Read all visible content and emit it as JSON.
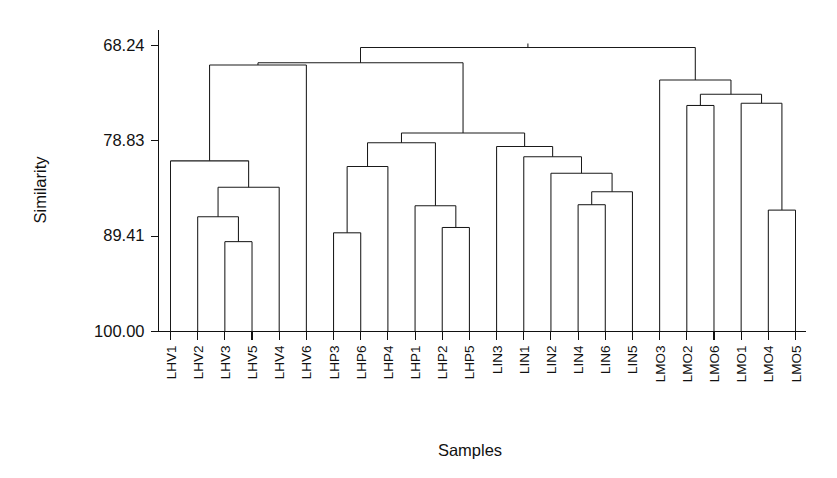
{
  "chart_data": {
    "type": "dendrogram",
    "title": "",
    "xlabel": "Samples",
    "ylabel": "Similarity",
    "grid": false,
    "legend": null,
    "axis_inverted": true,
    "ylim": [
      68.24,
      100.0
    ],
    "ytick_labels": [
      "68.24",
      "78.83",
      "89.41",
      "100.00"
    ],
    "ytick_values": [
      68.24,
      78.83,
      89.41,
      100.0
    ],
    "leaf_labels": [
      "LHV1",
      "LHV2",
      "LHV3",
      "LHV5",
      "LHV4",
      "LHV6",
      "LHP3",
      "LHP6",
      "LHP4",
      "LHP1",
      "LHP2",
      "LHP5",
      "LIN3",
      "LIN1",
      "LIN2",
      "LIN4",
      "LIN6",
      "LIN5",
      "LMO3",
      "LMO2",
      "LMO6",
      "LMO1",
      "LMO4",
      "LMO5"
    ],
    "n_leaves": 24,
    "groups": [
      {
        "name": "LHV",
        "members": [
          "LHV1",
          "LHV2",
          "LHV3",
          "LHV5",
          "LHV4",
          "LHV6"
        ]
      },
      {
        "name": "LHP",
        "members": [
          "LHP3",
          "LHP6",
          "LHP4",
          "LHP1",
          "LHP2",
          "LHP5"
        ]
      },
      {
        "name": "LIN",
        "members": [
          "LIN3",
          "LIN1",
          "LIN2",
          "LIN4",
          "LIN6",
          "LIN5"
        ]
      },
      {
        "name": "LMO",
        "members": [
          "LMO3",
          "LMO2",
          "LMO6",
          "LMO1",
          "LMO4",
          "LMO5"
        ]
      }
    ],
    "merges": [
      {
        "id": "m1",
        "left": "LHV3",
        "right": "LHV5",
        "similarity": 90.02
      },
      {
        "id": "m2",
        "left": "LHV2",
        "right": "m1",
        "similarity": 87.25
      },
      {
        "id": "m3",
        "left": "m2",
        "right": "LHV4",
        "similarity": 83.99
      },
      {
        "id": "m4",
        "left": "LHV1",
        "right": "m3",
        "similarity": 81.05
      },
      {
        "id": "m5",
        "left": "m4",
        "right": "LHV6",
        "similarity": 70.41
      },
      {
        "id": "m6",
        "left": "LHP3",
        "right": "LHP6",
        "similarity": 89.04
      },
      {
        "id": "m7",
        "left": "m6",
        "right": "LHP4",
        "similarity": 81.67
      },
      {
        "id": "m8",
        "left": "LHP2",
        "right": "LHP5",
        "similarity": 88.45
      },
      {
        "id": "m9",
        "left": "LHP1",
        "right": "m8",
        "similarity": 86.04
      },
      {
        "id": "m10",
        "left": "m7",
        "right": "m9",
        "similarity": 79.04
      },
      {
        "id": "m11",
        "left": "LIN4",
        "right": "LIN6",
        "similarity": 85.92
      },
      {
        "id": "m12",
        "left": "m11",
        "right": "LIN5",
        "similarity": 84.47
      },
      {
        "id": "m13",
        "left": "LIN2",
        "right": "m12",
        "similarity": 82.42
      },
      {
        "id": "m14",
        "left": "LIN1",
        "right": "m13",
        "similarity": 80.6
      },
      {
        "id": "m15",
        "left": "LIN3",
        "right": "m14",
        "similarity": 79.46
      },
      {
        "id": "m16",
        "left": "m10",
        "right": "m15",
        "similarity": 77.95
      },
      {
        "id": "m17",
        "left": "m5",
        "right": "m16",
        "similarity": 70.16
      },
      {
        "id": "m18",
        "left": "LMO4",
        "right": "LMO5",
        "similarity": 86.52
      },
      {
        "id": "m19",
        "left": "LMO1",
        "right": "m18",
        "similarity": 74.66
      },
      {
        "id": "m20",
        "left": "LMO2",
        "right": "LMO6",
        "similarity": 74.9
      },
      {
        "id": "m21",
        "left": "m20",
        "right": "m19",
        "similarity": 73.66
      },
      {
        "id": "m22",
        "left": "LMO3",
        "right": "m21",
        "similarity": 72.08
      },
      {
        "id": "m23",
        "left": "m17",
        "right": "m22",
        "similarity": 68.46
      }
    ]
  }
}
